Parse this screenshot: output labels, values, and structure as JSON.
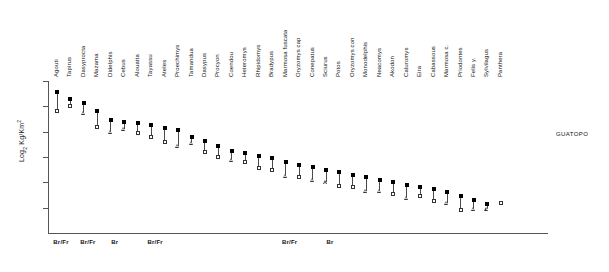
{
  "chart_data": {
    "type": "scatter",
    "title": "",
    "site_caption": "GUATOPO",
    "ylabel": "Log2 Kg/Km2",
    "ylabel_parts": {
      "prefix": "Log",
      "sub": "2",
      "mid": " Kg/Km",
      "sup": "2"
    },
    "xlabel": "",
    "grid": false,
    "legend": "none",
    "ylim": [
      -6,
      6
    ],
    "y_ticks": [
      6,
      4,
      2,
      0,
      -2,
      -4
    ],
    "y_tick_labels_shown": false,
    "marker_upper": "filled-square",
    "marker_lower": "open-square-or-triangle",
    "categories": [
      "Agouti",
      "Tapirus",
      "Dasyprocta",
      "Mazama",
      "Didelphis",
      "Cebus",
      "Alouatta",
      "Tayassu",
      "Ateles",
      "Proechimys",
      "Tamandua",
      "Dasypus",
      "Procyon",
      "Coendou",
      "Heteromys",
      "Rhipidomys",
      "Bradypus",
      "Marmosa fuscata",
      "Oryzomys cap",
      "Conepatus",
      "Sciurus",
      "Potos",
      "Oryzomys con",
      "Monodelphis",
      "Neacomys",
      "Akodon",
      "Caluromys",
      "Eira",
      "Cabassous",
      "Marmosa c.",
      "Priodontes",
      "Felis y.",
      "Sylvilagus",
      "Panthera"
    ],
    "series": [
      {
        "name": "upper estimate",
        "marker": "filled-square",
        "values": [
          5.1,
          4.6,
          4.3,
          3.6,
          2.9,
          2.8,
          2.7,
          2.5,
          2.3,
          2.1,
          1.6,
          1.3,
          0.9,
          0.5,
          0.3,
          0.1,
          -0.1,
          -0.4,
          -0.6,
          -0.8,
          -1.0,
          -1.2,
          -1.4,
          -1.6,
          -1.8,
          -2.0,
          -2.2,
          -2.4,
          -2.5,
          -2.8,
          -3.1,
          -3.4,
          -3.7,
          -3.6
        ]
      },
      {
        "name": "lower estimate",
        "marker": "open-square",
        "values": [
          3.6,
          4.0,
          3.5,
          2.4,
          2.0,
          2.2,
          1.9,
          1.6,
          1.2,
          0.9,
          1.1,
          0.4,
          0.0,
          -0.2,
          -0.4,
          -0.9,
          -1.0,
          -1.5,
          -1.6,
          -1.8,
          -2.0,
          -2.3,
          -2.4,
          -2.7,
          -2.7,
          -2.9,
          -3.2,
          -3.1,
          -3.5,
          -3.6,
          -4.2,
          -4.1,
          -4.1,
          -3.6
        ]
      }
    ],
    "lower_marker_shapes": [
      "square",
      "square",
      "triangle",
      "square",
      "triangle",
      "triangle",
      "square",
      "square",
      "square",
      "triangle",
      "triangle",
      "square",
      "square",
      "triangle",
      "square",
      "square",
      "square",
      "triangle",
      "square",
      "triangle",
      "triangle",
      "square",
      "square",
      "triangle",
      "triangle",
      "square",
      "triangle",
      "square",
      "square",
      "triangle",
      "square",
      "triangle",
      "triangle",
      "square"
    ],
    "habitat_groups": [
      {
        "label": "Br/Fr",
        "x_category_index": 0
      },
      {
        "label": "Br/Fr",
        "x_category_index": 2
      },
      {
        "label": "Br",
        "x_category_index": 4
      },
      {
        "label": "Br/Fr",
        "x_category_index": 7
      },
      {
        "label": "Br/Fr",
        "x_category_index": 17
      },
      {
        "label": "Br",
        "x_category_index": 20
      }
    ]
  }
}
